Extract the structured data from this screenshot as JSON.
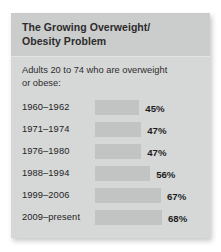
{
  "card": {
    "title": "The Growing Overweight/\nObesity Problem",
    "subtitle": "Adults 20 to 74 who are overweight\nor obese:",
    "background_color": "#d6d7d7",
    "header_color": "#cbcccc",
    "bar_color": "#c2c3c3",
    "text_color": "#232323"
  },
  "chart_data": {
    "type": "bar",
    "subtitle": "Adults 20 to 74 who are overweight or obese:",
    "orientation": "horizontal",
    "categories": [
      "1960–1962",
      "1971–1974",
      "1976–1980",
      "1988–1994",
      "1999–2006",
      "2009–present"
    ],
    "values": [
      45,
      47,
      47,
      56,
      67,
      68
    ],
    "value_labels": [
      "45%",
      "47%",
      "47%",
      "56%",
      "67%",
      "68%"
    ],
    "xlabel": "",
    "ylabel": "",
    "xlim": [
      0,
      100
    ],
    "unit": "%",
    "grid": false,
    "legend": false,
    "rows": [
      {
        "period": "1960–1962",
        "value": 45,
        "label": "45%"
      },
      {
        "period": "1971–1974",
        "value": 47,
        "label": "47%"
      },
      {
        "period": "1976–1980",
        "value": 47,
        "label": "47%"
      },
      {
        "period": "1988–1994",
        "value": 56,
        "label": "56%"
      },
      {
        "period": "1999–2006",
        "value": 67,
        "label": "67%"
      },
      {
        "period": "2009–present",
        "value": 68,
        "label": "68%"
      }
    ]
  }
}
